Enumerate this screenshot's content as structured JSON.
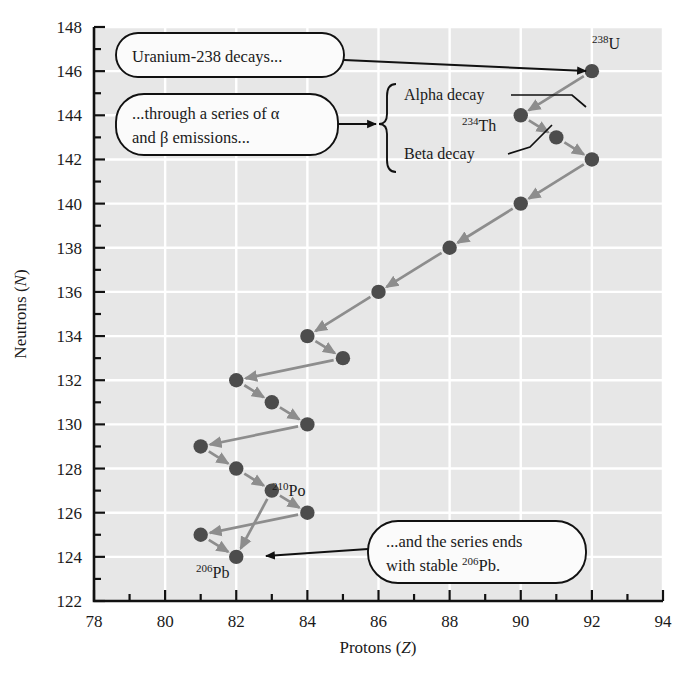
{
  "chart_data": {
    "type": "scatter",
    "title": "",
    "xlabel": "Protons (Z)",
    "ylabel": "Neutrons (N)",
    "xlim": [
      78,
      94
    ],
    "ylim": [
      122,
      148
    ],
    "xticks": [
      78,
      80,
      82,
      84,
      86,
      88,
      90,
      92,
      94
    ],
    "yticks": [
      122,
      124,
      126,
      128,
      130,
      132,
      134,
      136,
      138,
      140,
      142,
      144,
      146,
      148
    ],
    "xtick_step": 2,
    "ytick_step": 2,
    "minor_tick_step": 1,
    "grid": true,
    "grid_color": "#ffffff",
    "plot_bg": "#e7e7e7",
    "point_color": "#4c4c4c",
    "arrow_color": "#8d8d8d",
    "legend": null,
    "points": [
      {
        "z": 92,
        "n": 146,
        "label": "238U"
      },
      {
        "z": 90,
        "n": 144,
        "label": "234Th"
      },
      {
        "z": 91,
        "n": 143,
        "label": ""
      },
      {
        "z": 92,
        "n": 142,
        "label": ""
      },
      {
        "z": 90,
        "n": 140,
        "label": ""
      },
      {
        "z": 88,
        "n": 138,
        "label": ""
      },
      {
        "z": 86,
        "n": 136,
        "label": ""
      },
      {
        "z": 84,
        "n": 134,
        "label": ""
      },
      {
        "z": 85,
        "n": 133,
        "label": ""
      },
      {
        "z": 82,
        "n": 132,
        "label": ""
      },
      {
        "z": 83,
        "n": 131,
        "label": ""
      },
      {
        "z": 84,
        "n": 130,
        "label": ""
      },
      {
        "z": 81,
        "n": 129,
        "label": ""
      },
      {
        "z": 82,
        "n": 128,
        "label": ""
      },
      {
        "z": 83,
        "n": 127,
        "label": ""
      },
      {
        "z": 84,
        "n": 126,
        "label": "210Po"
      },
      {
        "z": 81,
        "n": 125,
        "label": ""
      },
      {
        "z": 82,
        "n": 124,
        "label": "206Pb"
      }
    ],
    "arrows": [
      {
        "from": [
          92,
          146
        ],
        "to": [
          90,
          144
        ],
        "kind": "alpha"
      },
      {
        "from": [
          90,
          144
        ],
        "to": [
          91,
          143
        ],
        "kind": "beta"
      },
      {
        "from": [
          91,
          143
        ],
        "to": [
          92,
          142
        ],
        "kind": "beta"
      },
      {
        "from": [
          92,
          142
        ],
        "to": [
          90,
          140
        ],
        "kind": "alpha"
      },
      {
        "from": [
          90,
          140
        ],
        "to": [
          88,
          138
        ],
        "kind": "alpha"
      },
      {
        "from": [
          88,
          138
        ],
        "to": [
          86,
          136
        ],
        "kind": "alpha"
      },
      {
        "from": [
          86,
          136
        ],
        "to": [
          84,
          134
        ],
        "kind": "alpha"
      },
      {
        "from": [
          85,
          133
        ],
        "to": [
          82,
          132
        ],
        "kind": "alpha"
      },
      {
        "from": [
          84,
          134
        ],
        "to": [
          85,
          133
        ],
        "kind": "beta"
      },
      {
        "from": [
          82,
          132
        ],
        "to": [
          83,
          131
        ],
        "kind": "beta"
      },
      {
        "from": [
          83,
          131
        ],
        "to": [
          84,
          130
        ],
        "kind": "beta"
      },
      {
        "from": [
          84,
          130
        ],
        "to": [
          81,
          129
        ],
        "kind": "alpha"
      },
      {
        "from": [
          81,
          129
        ],
        "to": [
          82,
          128
        ],
        "kind": "beta"
      },
      {
        "from": [
          82,
          128
        ],
        "to": [
          83,
          127
        ],
        "kind": "beta"
      },
      {
        "from": [
          83,
          127
        ],
        "to": [
          84,
          126
        ],
        "kind": "beta"
      },
      {
        "from": [
          84,
          126
        ],
        "to": [
          81,
          125
        ],
        "kind": "alpha"
      },
      {
        "from": [
          81,
          125
        ],
        "to": [
          82,
          124
        ],
        "kind": "beta"
      },
      {
        "from": [
          83,
          127
        ],
        "to": [
          82,
          124
        ],
        "kind": "alpha"
      }
    ]
  },
  "nuclide_labels": {
    "u238": {
      "mass": "238",
      "symbol": "U"
    },
    "th234": {
      "mass": "234",
      "symbol": "Th"
    },
    "po210": {
      "mass": "210",
      "symbol": "Po"
    },
    "pb206": {
      "mass": "206",
      "symbol": "Pb"
    }
  },
  "decay_labels": {
    "alpha": "Alpha decay",
    "beta": "Beta decay"
  },
  "callouts": [
    {
      "id": "callout-start",
      "lines": [
        "Uranium-238 decays..."
      ]
    },
    {
      "id": "callout-middle",
      "lines": [
        "...through a series of α",
        "and β emissions..."
      ]
    },
    {
      "id": "callout-end",
      "lines": [
        "...and the series ends",
        "with stable "
      ],
      "end_sup": "206",
      "end_symbol": "Pb."
    }
  ],
  "axes": {
    "x_title": "Protons (Z)",
    "x_title_main": "Protons (",
    "x_title_italic": "Z",
    "x_title_close": ")",
    "y_title_main": "Neutrons (",
    "y_title_italic": "N",
    "y_title_close": ")",
    "xtick_labels": [
      "78",
      "80",
      "82",
      "84",
      "86",
      "88",
      "90",
      "92",
      "94"
    ],
    "ytick_labels": [
      "122",
      "124",
      "126",
      "128",
      "130",
      "132",
      "134",
      "136",
      "138",
      "140",
      "142",
      "144",
      "146",
      "148"
    ]
  }
}
